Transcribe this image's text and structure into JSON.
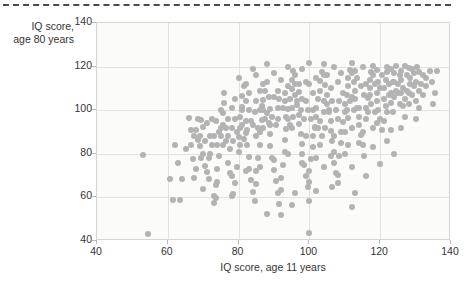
{
  "decor": {
    "top_rule_name": "dashed-divider"
  },
  "chart_data": {
    "type": "scatter",
    "title": "",
    "xlabel": "IQ score, age 11 years",
    "ylabel": "IQ score,\nage 80 years",
    "xlim": [
      40,
      140
    ],
    "ylim": [
      40,
      140
    ],
    "xticks": [
      40,
      60,
      80,
      100,
      120,
      140
    ],
    "yticks": [
      40,
      60,
      80,
      100,
      120,
      140
    ],
    "grid": true,
    "legend": "none",
    "marker": {
      "color": "#b3b3b3",
      "size_px": 6,
      "shape": "circle"
    },
    "n_points": 380,
    "points": [
      [
        53.0,
        79.5
      ],
      [
        54.5,
        43.0
      ],
      [
        60.5,
        68.5
      ],
      [
        61.5,
        59.0
      ],
      [
        63.5,
        59.0
      ],
      [
        64.0,
        68.5
      ],
      [
        66.0,
        96.5
      ],
      [
        66.5,
        84.0
      ],
      [
        67.5,
        69.0
      ],
      [
        67.0,
        77.5
      ],
      [
        68.0,
        91.0
      ],
      [
        68.5,
        86.5
      ],
      [
        69.0,
        83.5
      ],
      [
        69.5,
        95.5
      ],
      [
        70.0,
        92.5
      ],
      [
        70.5,
        74.5
      ],
      [
        71.0,
        71.5
      ],
      [
        71.5,
        68.5
      ],
      [
        72.0,
        80.0
      ],
      [
        72.5,
        96.0
      ],
      [
        73.0,
        60.5
      ],
      [
        73.0,
        57.5
      ],
      [
        73.5,
        59.5
      ],
      [
        73.5,
        65.5
      ],
      [
        74.0,
        73.0
      ],
      [
        74.5,
        79.0
      ],
      [
        75.0,
        88.0
      ],
      [
        75.5,
        93.0
      ],
      [
        75.5,
        98.5
      ],
      [
        76.0,
        103.5
      ],
      [
        76.5,
        86.0
      ],
      [
        77.0,
        76.0
      ],
      [
        77.5,
        71.0
      ],
      [
        78.0,
        60.5
      ],
      [
        78.5,
        61.5
      ],
      [
        79.0,
        66.5
      ],
      [
        79.5,
        74.0
      ],
      [
        80.0,
        81.0
      ],
      [
        80.0,
        87.5
      ],
      [
        80.5,
        92.0
      ],
      [
        80.5,
        97.0
      ],
      [
        81.0,
        101.5
      ],
      [
        81.0,
        106.5
      ],
      [
        81.5,
        111.0
      ],
      [
        82.0,
        95.0
      ],
      [
        82.0,
        89.5
      ],
      [
        82.5,
        84.0
      ],
      [
        83.0,
        78.5
      ],
      [
        83.0,
        73.0
      ],
      [
        83.5,
        68.0
      ],
      [
        84.0,
        62.5
      ],
      [
        84.5,
        58.5
      ],
      [
        85.0,
        66.0
      ],
      [
        85.0,
        72.0
      ],
      [
        85.5,
        78.0
      ],
      [
        86.0,
        84.0
      ],
      [
        86.0,
        90.0
      ],
      [
        86.5,
        95.5
      ],
      [
        87.0,
        100.0
      ],
      [
        87.0,
        104.5
      ],
      [
        87.5,
        109.0
      ],
      [
        88.0,
        113.0
      ],
      [
        88.0,
        98.5
      ],
      [
        88.5,
        94.0
      ],
      [
        89.0,
        89.0
      ],
      [
        89.0,
        83.5
      ],
      [
        89.5,
        78.0
      ],
      [
        90.0,
        72.5
      ],
      [
        90.5,
        67.5
      ],
      [
        91.0,
        62.0
      ],
      [
        91.5,
        57.0
      ],
      [
        92.0,
        63.5
      ],
      [
        92.0,
        69.0
      ],
      [
        92.5,
        75.0
      ],
      [
        93.0,
        81.0
      ],
      [
        93.0,
        86.5
      ],
      [
        93.5,
        91.5
      ],
      [
        94.0,
        96.0
      ],
      [
        94.0,
        100.5
      ],
      [
        94.5,
        105.0
      ],
      [
        95.0,
        109.5
      ],
      [
        95.0,
        114.0
      ],
      [
        95.5,
        118.0
      ],
      [
        96.0,
        112.0
      ],
      [
        96.0,
        107.0
      ],
      [
        96.5,
        102.5
      ],
      [
        97.0,
        98.0
      ],
      [
        97.0,
        93.5
      ],
      [
        97.5,
        89.0
      ],
      [
        98.0,
        84.5
      ],
      [
        98.0,
        80.0
      ],
      [
        98.5,
        75.0
      ],
      [
        99.0,
        70.0
      ],
      [
        99.5,
        65.0
      ],
      [
        100.0,
        58.5
      ],
      [
        100.0,
        72.0
      ],
      [
        100.5,
        77.5
      ],
      [
        101.0,
        83.0
      ],
      [
        101.0,
        88.0
      ],
      [
        101.5,
        92.5
      ],
      [
        102.0,
        97.0
      ],
      [
        102.0,
        101.0
      ],
      [
        102.5,
        105.0
      ],
      [
        103.0,
        109.0
      ],
      [
        103.0,
        113.5
      ],
      [
        103.5,
        117.5
      ],
      [
        104.0,
        121.0
      ],
      [
        104.0,
        116.0
      ],
      [
        104.5,
        111.5
      ],
      [
        105.0,
        107.0
      ],
      [
        105.0,
        103.0
      ],
      [
        105.5,
        99.0
      ],
      [
        106.0,
        95.0
      ],
      [
        106.0,
        90.5
      ],
      [
        106.5,
        86.0
      ],
      [
        107.0,
        81.0
      ],
      [
        107.0,
        76.0
      ],
      [
        107.5,
        71.0
      ],
      [
        108.0,
        66.5
      ],
      [
        108.5,
        79.0
      ],
      [
        109.0,
        85.0
      ],
      [
        109.0,
        90.0
      ],
      [
        109.5,
        94.5
      ],
      [
        110.0,
        99.0
      ],
      [
        110.0,
        103.0
      ],
      [
        110.5,
        107.0
      ],
      [
        111.0,
        111.0
      ],
      [
        111.0,
        115.0
      ],
      [
        111.5,
        118.5
      ],
      [
        112.0,
        121.5
      ],
      [
        112.0,
        117.0
      ],
      [
        112.5,
        113.0
      ],
      [
        113.0,
        109.0
      ],
      [
        113.0,
        105.0
      ],
      [
        113.5,
        101.0
      ],
      [
        114.0,
        97.0
      ],
      [
        114.0,
        93.0
      ],
      [
        114.5,
        88.5
      ],
      [
        115.0,
        84.0
      ],
      [
        115.5,
        79.0
      ],
      [
        116.0,
        96.0
      ],
      [
        116.0,
        101.0
      ],
      [
        116.5,
        105.5
      ],
      [
        117.0,
        110.0
      ],
      [
        117.0,
        114.0
      ],
      [
        117.5,
        117.5
      ],
      [
        118.0,
        120.5
      ],
      [
        118.0,
        116.0
      ],
      [
        118.5,
        112.0
      ],
      [
        119.0,
        108.0
      ],
      [
        119.0,
        104.0
      ],
      [
        119.5,
        100.0
      ],
      [
        120.0,
        96.0
      ],
      [
        120.5,
        91.0
      ],
      [
        121.0,
        105.0
      ],
      [
        121.0,
        110.0
      ],
      [
        121.5,
        114.0
      ],
      [
        122.0,
        117.5
      ],
      [
        122.0,
        120.0
      ],
      [
        122.5,
        112.0
      ],
      [
        123.0,
        108.0
      ],
      [
        123.0,
        103.5
      ],
      [
        123.5,
        99.0
      ],
      [
        124.0,
        113.0
      ],
      [
        124.0,
        117.0
      ],
      [
        124.5,
        120.5
      ],
      [
        125.0,
        108.0
      ],
      [
        125.5,
        103.0
      ],
      [
        126.0,
        114.0
      ],
      [
        126.0,
        118.0
      ],
      [
        126.5,
        110.0
      ],
      [
        127.0,
        105.0
      ],
      [
        127.5,
        116.0
      ],
      [
        128.0,
        119.5
      ],
      [
        128.5,
        112.0
      ],
      [
        129.0,
        107.0
      ],
      [
        129.5,
        117.0
      ],
      [
        130.0,
        113.0
      ],
      [
        130.5,
        120.0
      ],
      [
        131.0,
        109.0
      ],
      [
        132.0,
        116.0
      ],
      [
        133.0,
        111.0
      ],
      [
        134.0,
        118.0
      ],
      [
        106.5,
        65.0
      ],
      [
        113.0,
        62.0
      ],
      [
        100.0,
        43.5
      ],
      [
        88.0,
        52.5
      ],
      [
        92.0,
        52.0
      ],
      [
        95.0,
        56.5
      ],
      [
        112.0,
        55.5
      ],
      [
        84.0,
        93.0
      ],
      [
        86.0,
        100.0
      ],
      [
        78.0,
        92.0
      ],
      [
        74.0,
        84.0
      ],
      [
        72.0,
        88.0
      ],
      [
        70.0,
        80.0
      ],
      [
        68.0,
        73.0
      ],
      [
        82.0,
        112.0
      ],
      [
        90.0,
        117.0
      ],
      [
        94.0,
        120.0
      ],
      [
        98.0,
        119.0
      ],
      [
        85.0,
        116.0
      ],
      [
        91.0,
        109.0
      ],
      [
        99.0,
        113.0
      ],
      [
        103.0,
        95.0
      ],
      [
        107.0,
        120.0
      ],
      [
        111.0,
        96.5
      ],
      [
        115.0,
        120.0
      ],
      [
        119.0,
        118.5
      ],
      [
        123.0,
        119.0
      ],
      [
        127.0,
        120.5
      ],
      [
        131.0,
        117.5
      ],
      [
        134.5,
        113.0
      ],
      [
        136.0,
        118.0
      ],
      [
        97.0,
        108.5
      ],
      [
        93.0,
        104.0
      ],
      [
        89.0,
        100.5
      ],
      [
        85.0,
        104.0
      ],
      [
        81.0,
        100.0
      ],
      [
        77.0,
        96.0
      ],
      [
        75.0,
        100.0
      ],
      [
        79.0,
        105.0
      ],
      [
        83.0,
        108.0
      ],
      [
        87.0,
        112.0
      ],
      [
        91.0,
        96.0
      ],
      [
        95.0,
        92.0
      ],
      [
        99.0,
        88.0
      ],
      [
        103.0,
        84.0
      ],
      [
        107.0,
        88.0
      ],
      [
        111.0,
        84.0
      ],
      [
        115.0,
        90.0
      ],
      [
        119.0,
        94.0
      ],
      [
        123.0,
        91.0
      ],
      [
        127.0,
        97.0
      ],
      [
        131.0,
        101.0
      ],
      [
        104.0,
        74.0
      ],
      [
        108.0,
        70.5
      ],
      [
        100.0,
        67.0
      ],
      [
        96.0,
        62.0
      ],
      [
        112.0,
        74.0
      ],
      [
        116.0,
        70.0
      ],
      [
        120.0,
        75.5
      ],
      [
        124.0,
        80.0
      ],
      [
        118.0,
        83.0
      ],
      [
        122.0,
        86.0
      ],
      [
        126.0,
        92.0
      ],
      [
        130.0,
        96.0
      ],
      [
        102.0,
        63.0
      ],
      [
        98.0,
        105.0
      ],
      [
        94.0,
        111.0
      ],
      [
        90.0,
        106.0
      ],
      [
        86.0,
        109.0
      ],
      [
        82.0,
        104.0
      ],
      [
        78.0,
        101.0
      ],
      [
        76.0,
        108.0
      ],
      [
        80.0,
        115.0
      ],
      [
        84.0,
        119.0
      ],
      [
        88.0,
        121.0
      ],
      [
        92.0,
        114.0
      ],
      [
        96.0,
        116.0
      ],
      [
        100.0,
        121.5
      ],
      [
        104.0,
        104.0
      ],
      [
        108.0,
        113.0
      ],
      [
        112.0,
        106.0
      ],
      [
        116.0,
        112.0
      ],
      [
        120.0,
        110.0
      ],
      [
        124.0,
        106.0
      ],
      [
        128.0,
        103.0
      ],
      [
        132.0,
        107.0
      ],
      [
        135.0,
        103.0
      ],
      [
        99.5,
        100.0
      ],
      [
        100.5,
        96.0
      ],
      [
        101.5,
        92.0
      ],
      [
        98.5,
        96.0
      ],
      [
        97.5,
        100.0
      ],
      [
        96.5,
        104.0
      ],
      [
        95.5,
        97.0
      ],
      [
        94.5,
        93.0
      ],
      [
        93.5,
        97.0
      ],
      [
        92.5,
        101.0
      ],
      [
        91.5,
        105.0
      ],
      [
        90.5,
        93.0
      ],
      [
        89.5,
        97.0
      ],
      [
        88.5,
        106.0
      ],
      [
        87.5,
        96.0
      ],
      [
        86.5,
        102.0
      ],
      [
        85.5,
        92.0
      ],
      [
        84.5,
        99.0
      ],
      [
        83.5,
        95.0
      ],
      [
        82.5,
        91.0
      ],
      [
        81.5,
        87.0
      ],
      [
        80.5,
        84.0
      ],
      [
        79.5,
        90.0
      ],
      [
        78.5,
        86.0
      ],
      [
        77.5,
        82.0
      ],
      [
        76.5,
        92.0
      ],
      [
        75.5,
        84.0
      ],
      [
        74.5,
        90.0
      ],
      [
        73.5,
        95.0
      ],
      [
        72.5,
        84.0
      ],
      [
        71.5,
        78.0
      ],
      [
        70.5,
        86.0
      ],
      [
        69.5,
        78.0
      ],
      [
        68.5,
        96.0
      ],
      [
        67.5,
        88.0
      ],
      [
        105.5,
        100.0
      ],
      [
        106.5,
        104.0
      ],
      [
        107.5,
        100.0
      ],
      [
        108.5,
        104.0
      ],
      [
        109.5,
        108.0
      ],
      [
        110.5,
        100.0
      ],
      [
        111.5,
        104.0
      ],
      [
        112.5,
        100.0
      ],
      [
        113.5,
        115.0
      ],
      [
        114.5,
        111.0
      ],
      [
        115.5,
        107.0
      ],
      [
        116.5,
        99.0
      ],
      [
        117.5,
        103.0
      ],
      [
        118.5,
        99.0
      ],
      [
        119.5,
        113.0
      ],
      [
        120.5,
        116.0
      ],
      [
        121.5,
        102.0
      ],
      [
        122.5,
        107.0
      ],
      [
        123.5,
        113.0
      ],
      [
        124.5,
        109.0
      ],
      [
        125.5,
        116.0
      ],
      [
        126.5,
        102.0
      ],
      [
        127.5,
        109.0
      ],
      [
        128.5,
        115.0
      ],
      [
        129.5,
        111.0
      ],
      [
        104.5,
        92.0
      ],
      [
        103.5,
        88.0
      ],
      [
        102.5,
        92.0
      ],
      [
        101.0,
        108.0
      ],
      [
        100.0,
        112.0
      ],
      [
        99.0,
        104.0
      ],
      [
        97.0,
        112.0
      ],
      [
        95.0,
        101.0
      ],
      [
        93.0,
        108.0
      ],
      [
        91.0,
        101.0
      ],
      [
        89.0,
        93.0
      ],
      [
        87.0,
        92.0
      ],
      [
        85.0,
        88.0
      ],
      [
        83.0,
        100.0
      ],
      [
        81.0,
        93.0
      ],
      [
        79.0,
        96.0
      ],
      [
        77.0,
        88.0
      ],
      [
        75.0,
        92.0
      ],
      [
        73.0,
        88.0
      ],
      [
        71.0,
        94.0
      ],
      [
        69.0,
        88.0
      ],
      [
        66.5,
        91.0
      ],
      [
        65.0,
        82.0
      ],
      [
        63.0,
        76.0
      ],
      [
        62.0,
        84.0
      ],
      [
        110.0,
        90.0
      ],
      [
        114.0,
        101.0
      ],
      [
        106.0,
        110.0
      ],
      [
        102.0,
        115.0
      ],
      [
        109.0,
        117.0
      ],
      [
        113.0,
        118.0
      ],
      [
        117.0,
        107.0
      ],
      [
        121.0,
        95.0
      ],
      [
        125.0,
        112.0
      ],
      [
        129.0,
        119.0
      ],
      [
        133.0,
        115.0
      ],
      [
        135.5,
        108.0
      ],
      [
        131.5,
        112.0
      ],
      [
        128.0,
        108.0
      ],
      [
        130.0,
        104.0
      ],
      [
        126.0,
        108.0
      ],
      [
        122.0,
        99.0
      ],
      [
        118.0,
        92.0
      ],
      [
        114.0,
        85.0
      ],
      [
        110.0,
        80.0
      ],
      [
        106.0,
        79.0
      ],
      [
        102.0,
        78.0
      ],
      [
        98.0,
        76.0
      ],
      [
        94.0,
        80.0
      ],
      [
        90.0,
        77.0
      ],
      [
        86.0,
        74.0
      ],
      [
        82.0,
        72.0
      ],
      [
        78.0,
        70.0
      ],
      [
        74.0,
        67.0
      ],
      [
        70.0,
        64.0
      ],
      [
        105.0,
        116.0
      ],
      [
        108.0,
        96.0
      ],
      [
        101.0,
        100.0
      ],
      [
        104.0,
        99.0
      ],
      [
        112.0,
        92.0
      ]
    ]
  }
}
